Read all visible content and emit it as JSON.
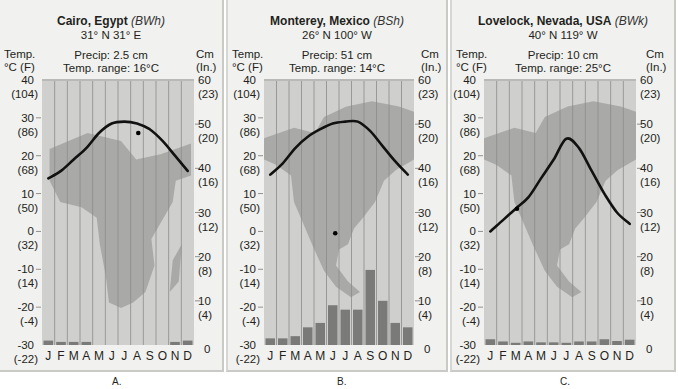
{
  "figure": {
    "left_axis_header": [
      "Temp.",
      "°C (F)"
    ],
    "right_axis_header": [
      "Cm",
      "(In.)"
    ],
    "left_ticks": [
      {
        "c": 40,
        "f": "(104)"
      },
      {
        "c": 30,
        "f": "(86)"
      },
      {
        "c": 20,
        "f": "(68)"
      },
      {
        "c": 10,
        "f": "(50)"
      },
      {
        "c": 0,
        "f": "(32)"
      },
      {
        "c": -10,
        "f": "(14)"
      },
      {
        "c": -20,
        "f": "(-4)"
      },
      {
        "c": -30,
        "f": "(-22)"
      }
    ],
    "right_ticks": [
      {
        "cm": 60,
        "in": "(23)"
      },
      {
        "cm": 50,
        "in": "(20)"
      },
      {
        "cm": 40,
        "in": "(16)"
      },
      {
        "cm": 30,
        "in": "(12)"
      },
      {
        "cm": 20,
        "in": "(8)"
      },
      {
        "cm": 10,
        "in": "(4)"
      },
      {
        "cm": 0,
        "in": ""
      }
    ],
    "months": [
      "J",
      "F",
      "M",
      "A",
      "M",
      "J",
      "J",
      "A",
      "S",
      "O",
      "N",
      "D"
    ],
    "colors": {
      "panel_bg": "#f1f1ef",
      "plot_bg": "#cfcfcd",
      "map_fill": "#a9a9a7",
      "grid_line": "#8c8c8a",
      "temp_line": "#111111",
      "precip_bar": "#7a7a78",
      "station_dot": "#000000"
    }
  },
  "panels": [
    {
      "caption": "A.",
      "name": "Cairo, Egypt",
      "code": "(BWh)",
      "coords": "31° N 31° E",
      "precip_label": "Precip: 2.5 cm",
      "range_label": "Temp. range: 16°C",
      "map": "africa"
    },
    {
      "caption": "B.",
      "name": "Monterey, Mexico",
      "code": "(BSh)",
      "coords": "26° N 100° W",
      "precip_label": "Precip: 51 cm",
      "range_label": "Temp. range: 14°C",
      "map": "north-america"
    },
    {
      "caption": "C.",
      "name": "Lovelock, Nevada, USA",
      "code": "(BWk)",
      "coords": "40° N 119° W",
      "precip_label": "Precip: 10 cm",
      "range_label": "Temp. range: 25°C",
      "map": "north-america"
    }
  ],
  "chart_data": [
    {
      "type": "line+bar",
      "title": "Cairo, Egypt (BWh) 31° N 31° E",
      "subtitle": "Precip: 2.5 cm, Temp. range: 16°C",
      "categories": [
        "J",
        "F",
        "M",
        "A",
        "M",
        "J",
        "J",
        "A",
        "S",
        "O",
        "N",
        "D"
      ],
      "series": [
        {
          "name": "Temperature (°C)",
          "type": "line",
          "axis": "left",
          "values": [
            14,
            16,
            19,
            22,
            26,
            28.5,
            29,
            28.5,
            27,
            24,
            20,
            16
          ]
        },
        {
          "name": "Precipitation (cm)",
          "type": "bar",
          "axis": "right",
          "values": [
            1.0,
            0.7,
            0.7,
            0.7,
            0,
            0,
            0,
            0,
            0,
            0,
            0.7,
            1.0
          ]
        }
      ],
      "ylabel_left": "Temp. °C (F)",
      "ylim_left": [
        -30,
        40
      ],
      "ylabel_right": "Cm (In.)",
      "ylim_right": [
        0,
        60
      ],
      "station_dot": {
        "month_index": 7.6,
        "temp": 26
      }
    },
    {
      "type": "line+bar",
      "title": "Monterey, Mexico (BSh) 26° N 100° W",
      "subtitle": "Precip: 51 cm, Temp. range: 14°C",
      "categories": [
        "J",
        "F",
        "M",
        "A",
        "M",
        "J",
        "J",
        "A",
        "S",
        "O",
        "N",
        "D"
      ],
      "series": [
        {
          "name": "Temperature (°C)",
          "type": "line",
          "axis": "left",
          "values": [
            15,
            18,
            22,
            25,
            27,
            28.5,
            29,
            29,
            26.5,
            22.5,
            18.5,
            15
          ]
        },
        {
          "name": "Precipitation (cm)",
          "type": "bar",
          "axis": "right",
          "values": [
            1.5,
            1.5,
            2,
            4,
            5,
            9,
            8,
            8,
            17,
            10,
            5,
            4
          ]
        }
      ],
      "ylabel_left": "Temp. °C (F)",
      "ylim_left": [
        -30,
        40
      ],
      "ylabel_right": "Cm (In.)",
      "ylim_right": [
        0,
        60
      ],
      "station_dot": {
        "month_index": 5.7,
        "temp": -0.5
      }
    },
    {
      "type": "line+bar",
      "title": "Lovelock, Nevada, USA (BWk) 40° N 119° W",
      "subtitle": "Precip: 10 cm, Temp. range: 25°C",
      "categories": [
        "J",
        "F",
        "M",
        "A",
        "M",
        "J",
        "J",
        "A",
        "S",
        "O",
        "N",
        "D"
      ],
      "series": [
        {
          "name": "Temperature (°C)",
          "type": "line",
          "axis": "left",
          "values": [
            0,
            3,
            6,
            9,
            14,
            19,
            24.5,
            22,
            16,
            10,
            5,
            2
          ]
        },
        {
          "name": "Precipitation (cm)",
          "type": "bar",
          "axis": "right",
          "values": [
            1.3,
            0.8,
            0.5,
            0.8,
            0.6,
            0.6,
            0.5,
            0.8,
            0.8,
            1.3,
            0.9,
            1.2
          ]
        }
      ],
      "ylabel_left": "Temp. °C (F)",
      "ylim_left": [
        -30,
        40
      ],
      "ylabel_right": "Cm (In.)",
      "ylim_right": [
        0,
        60
      ],
      "station_dot": {
        "month_index": 2.6,
        "temp": 6
      }
    }
  ]
}
